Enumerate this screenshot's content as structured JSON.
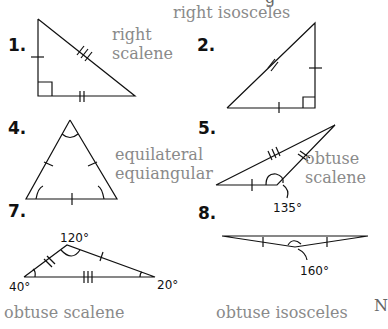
{
  "header_fragment": "g",
  "problems": [
    {
      "number": "1.",
      "answer_line1": "right",
      "answer_line2": "scalene"
    },
    {
      "number": "2.",
      "answer_line1": "right isosceles"
    },
    {
      "number": "4.",
      "answer_line1": "equilateral",
      "answer_line2": "equiangular"
    },
    {
      "number": "5.",
      "answer_line1": "obtuse",
      "answer_line2": "scalene",
      "angle_label": "135°"
    },
    {
      "number": "7.",
      "answer_line1": "obtuse scalene",
      "angles": [
        "120°",
        "40°",
        "20°"
      ]
    },
    {
      "number": "8.",
      "answer_line1": "obtuse isosceles",
      "angle_label": "160°"
    }
  ],
  "right_edge_fragment": "N"
}
